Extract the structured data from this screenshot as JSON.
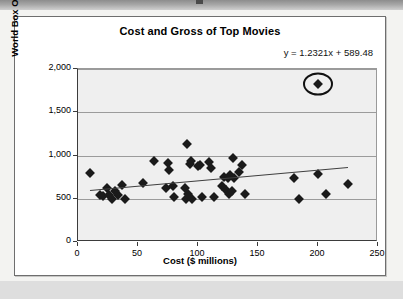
{
  "chart_data": {
    "type": "scatter",
    "title": "Cost and Gross of Top Movies",
    "xlabel": "Cost ($ millions)",
    "ylabel": "World Box Office millions",
    "xlim": [
      0,
      250
    ],
    "ylim": [
      0,
      2000
    ],
    "xticks": [
      "0",
      "50",
      "100",
      "150",
      "200",
      "250"
    ],
    "yticks": [
      "0",
      "500",
      "1,000",
      "1,500",
      "2,000"
    ],
    "xtick_values": [
      0,
      50,
      100,
      150,
      200,
      250
    ],
    "ytick_values": [
      0,
      500,
      1000,
      1500,
      2000
    ],
    "grid": "horizontal",
    "legend": "none",
    "annotation": "y = 1.2321x + 589.48",
    "trendline": {
      "slope": 1.2321,
      "intercept": 589.48,
      "x_start": 10,
      "x_end": 225
    },
    "highlight": {
      "shape": "ellipse",
      "label": "outlier-circle",
      "x": 200,
      "y": 1830
    },
    "points": [
      {
        "x": 10,
        "y": 800
      },
      {
        "x": 18,
        "y": 545
      },
      {
        "x": 21,
        "y": 535
      },
      {
        "x": 24,
        "y": 620
      },
      {
        "x": 26,
        "y": 545
      },
      {
        "x": 28,
        "y": 500
      },
      {
        "x": 31,
        "y": 585
      },
      {
        "x": 33,
        "y": 540
      },
      {
        "x": 37,
        "y": 660
      },
      {
        "x": 39,
        "y": 500
      },
      {
        "x": 54,
        "y": 680
      },
      {
        "x": 63,
        "y": 935
      },
      {
        "x": 73,
        "y": 625
      },
      {
        "x": 75,
        "y": 915
      },
      {
        "x": 76,
        "y": 835
      },
      {
        "x": 79,
        "y": 650
      },
      {
        "x": 80,
        "y": 515
      },
      {
        "x": 89,
        "y": 630
      },
      {
        "x": 90,
        "y": 495
      },
      {
        "x": 91,
        "y": 1130
      },
      {
        "x": 92,
        "y": 560
      },
      {
        "x": 93,
        "y": 900
      },
      {
        "x": 94,
        "y": 940
      },
      {
        "x": 95,
        "y": 495
      },
      {
        "x": 100,
        "y": 880
      },
      {
        "x": 102,
        "y": 885
      },
      {
        "x": 103,
        "y": 520
      },
      {
        "x": 109,
        "y": 930
      },
      {
        "x": 111,
        "y": 855
      },
      {
        "x": 113,
        "y": 520
      },
      {
        "x": 120,
        "y": 650
      },
      {
        "x": 122,
        "y": 755
      },
      {
        "x": 123,
        "y": 600
      },
      {
        "x": 125,
        "y": 735
      },
      {
        "x": 126,
        "y": 560
      },
      {
        "x": 127,
        "y": 780
      },
      {
        "x": 128,
        "y": 590
      },
      {
        "x": 129,
        "y": 975
      },
      {
        "x": 130,
        "y": 745
      },
      {
        "x": 134,
        "y": 815
      },
      {
        "x": 137,
        "y": 885
      },
      {
        "x": 139,
        "y": 555
      },
      {
        "x": 180,
        "y": 740
      },
      {
        "x": 184,
        "y": 500
      },
      {
        "x": 200,
        "y": 785
      },
      {
        "x": 200,
        "y": 1830
      },
      {
        "x": 207,
        "y": 550
      },
      {
        "x": 225,
        "y": 670
      }
    ]
  },
  "colors": {
    "marker": "#1a1a1a",
    "trendline": "#3f3f3f",
    "plot_background": "#efefef",
    "gridline": "#9b9b9b",
    "axis": "#3b3b3b",
    "card_background": "#ffffff",
    "page_background": "#f3f3f1"
  }
}
